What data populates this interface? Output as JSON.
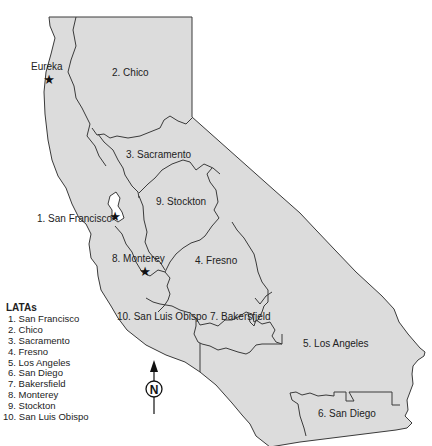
{
  "map": {
    "background_color": "#ffffff",
    "region_fill": "#dcdcdc",
    "boundary_color": "#3a3a3a",
    "region_labels": [
      {
        "id": "chico",
        "text": "2. Chico"
      },
      {
        "id": "sacramento",
        "text": "3. Sacramento"
      },
      {
        "id": "stockton",
        "text": "9. Stockton"
      },
      {
        "id": "san-francisco",
        "text": "1. San Francisco"
      },
      {
        "id": "monterey",
        "text": "8. Monterey"
      },
      {
        "id": "fresno",
        "text": "4. Fresno"
      },
      {
        "id": "san-luis-obispo",
        "text": "10. San Luis Obispo"
      },
      {
        "id": "bakersfield",
        "text": "7. Bakersfield"
      },
      {
        "id": "los-angeles",
        "text": "5. Los Angeles"
      },
      {
        "id": "san-diego",
        "text": "6. San Diego"
      }
    ],
    "city_markers": [
      {
        "id": "eureka",
        "label": "Eureka",
        "icon": "star-icon"
      },
      {
        "id": "san-francisco",
        "label": "",
        "icon": "star-icon"
      },
      {
        "id": "monterey",
        "label": "",
        "icon": "star-icon"
      }
    ],
    "compass": {
      "label": "N",
      "icon": "north-arrow-icon"
    }
  },
  "legend": {
    "title": "LATAs",
    "items": [
      "1. San Francisco",
      "2. Chico",
      "3. Sacramento",
      "4. Fresno",
      "5. Los Angeles",
      "6. San Diego",
      "7. Bakersfield",
      "8. Monterey",
      "9. Stockton",
      "10. San Luis Obispo"
    ]
  }
}
